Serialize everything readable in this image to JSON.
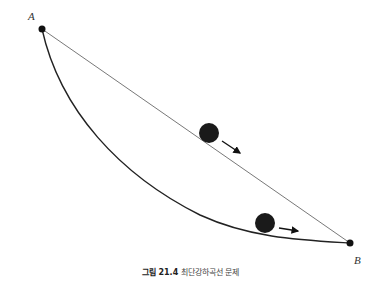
{
  "diagram": {
    "points": {
      "A": {
        "label": "A",
        "x": 42,
        "y": 29
      },
      "B": {
        "label": "B",
        "x": 350,
        "y": 243
      }
    },
    "paths": [
      {
        "name": "straight-line",
        "from": "A",
        "to": "B"
      },
      {
        "name": "brachistochrone-curve",
        "from": "A",
        "to": "B"
      }
    ],
    "balls": [
      {
        "name": "ball-on-line",
        "x": 209,
        "y": 133,
        "direction": "down-right along line"
      },
      {
        "name": "ball-on-curve",
        "x": 265,
        "y": 224,
        "direction": "right along curve"
      }
    ],
    "colors": {
      "line": "#555555",
      "curve": "#222222",
      "ball": "#111111"
    }
  },
  "caption": {
    "figure_number": "그림 21.4",
    "title": "최단강하곡선 문제"
  }
}
